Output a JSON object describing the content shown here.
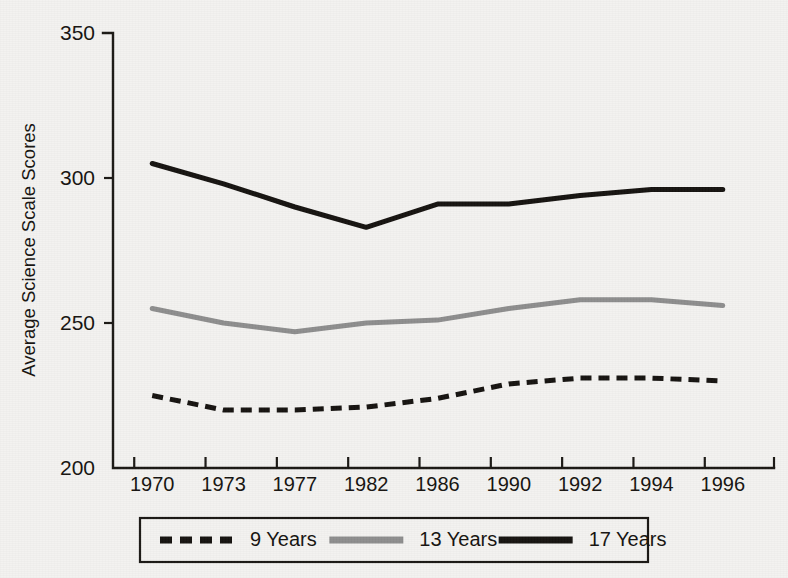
{
  "figure": {
    "background_color": "#f3f2f0",
    "ink_color": "#15120f"
  },
  "axes": {
    "y_title": "Average Science Scale Scores",
    "y_ticks": [
      "200",
      "250",
      "300",
      "350"
    ],
    "x_ticks": [
      "1970",
      "1973",
      "1977",
      "1982",
      "1986",
      "1990",
      "1992",
      "1994",
      "1996"
    ]
  },
  "legend": {
    "items": [
      {
        "label": "9 Years",
        "style": "dashed",
        "color": "#15120f"
      },
      {
        "label": "13 Years",
        "style": "solid",
        "color": "#8d8d8d"
      },
      {
        "label": "17 Years",
        "style": "solid",
        "color": "#15120f"
      }
    ]
  },
  "chart_data": {
    "type": "line",
    "title": "",
    "xlabel": "",
    "ylabel": "Average Science Scale Scores",
    "x": [
      1970,
      1973,
      1977,
      1982,
      1986,
      1990,
      1992,
      1994,
      1996
    ],
    "xtick_labels": [
      "1970",
      "1973",
      "1977",
      "1982",
      "1986",
      "1990",
      "1992",
      "1994",
      "1996"
    ],
    "ylim": [
      200,
      350
    ],
    "yticks": [
      200,
      250,
      300,
      350
    ],
    "grid": false,
    "legend_position": "below-axes",
    "series": [
      {
        "name": "9 Years",
        "color": "#15120f",
        "linestyle": "dashed",
        "linewidth": 5,
        "values": [
          225,
          220,
          220,
          221,
          224,
          229,
          231,
          231,
          230
        ]
      },
      {
        "name": "13 Years",
        "color": "#8d8d8d",
        "linestyle": "solid",
        "linewidth": 5,
        "values": [
          255,
          250,
          247,
          250,
          251,
          255,
          258,
          258,
          256
        ]
      },
      {
        "name": "17 Years",
        "color": "#15120f",
        "linestyle": "solid",
        "linewidth": 5,
        "values": [
          305,
          298,
          290,
          283,
          291,
          291,
          294,
          296,
          296
        ]
      }
    ]
  }
}
